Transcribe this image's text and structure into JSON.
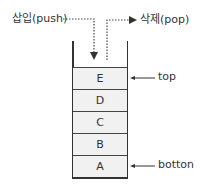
{
  "diagram": {
    "type": "stack",
    "push_label": "삽입(push)",
    "pop_label": "삭제(pop)",
    "cells": [
      "E",
      "D",
      "C",
      "B",
      "A"
    ],
    "pointers": {
      "top": "top",
      "bottom": "botton"
    }
  },
  "colors": {
    "cell_fill": "#f1f1f1",
    "line": "#333333"
  }
}
